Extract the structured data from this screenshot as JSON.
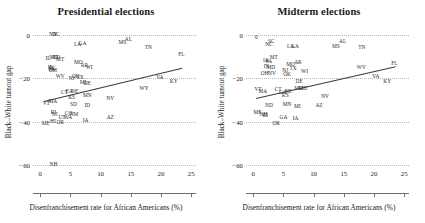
{
  "figure": {
    "yaxis_label": "Black–White turnout gap",
    "xaxis_label": "Disenfranchisement rate for African Americans (%)",
    "yticks": [
      "0",
      "−20",
      "−40",
      "−60"
    ],
    "xticks": [
      "0",
      "5",
      "10",
      "15",
      "20",
      "25"
    ],
    "line_color": "#3a3a3a",
    "grid_color": "#b9b9b9",
    "text_color": "#2b2b2b"
  },
  "chart_data": [
    {
      "type": "scatter",
      "title": "Presidential elections",
      "xlabel": "Disenfranchisement rate for African Americans (%)",
      "ylabel": "Black–White turnout gap",
      "xlim": [
        -1.2,
        25.8
      ],
      "ylim": [
        -65,
        3
      ],
      "xticks": [
        0,
        5,
        10,
        15,
        20,
        25
      ],
      "yticks": [
        0,
        -20,
        -40,
        -60
      ],
      "grid": "horizontal-dotted",
      "legend": "none",
      "point_labels": "US state abbreviations",
      "trendline": {
        "x": [
          0.6,
          23.5
        ],
        "y": [
          -30.5,
          -15.2
        ],
        "color": "#3a3a3a"
      },
      "points": [
        {
          "label": "NY",
          "x": 2.1,
          "y": -0.4
        },
        {
          "label": "DC",
          "x": 2.6,
          "y": -0.2
        },
        {
          "label": "LA",
          "x": 6.2,
          "y": -5.0
        },
        {
          "label": "GA",
          "x": 7.0,
          "y": -4.2
        },
        {
          "label": "AL",
          "x": 14.6,
          "y": -2.4
        },
        {
          "label": "MS",
          "x": 13.6,
          "y": -4.0
        },
        {
          "label": "TN",
          "x": 17.9,
          "y": -6.3
        },
        {
          "label": "FL",
          "x": 23.4,
          "y": -9.6
        },
        {
          "label": "IL",
          "x": 1.3,
          "y": -11.2
        },
        {
          "label": "MD",
          "x": 2.2,
          "y": -10.6
        },
        {
          "label": "ND",
          "x": 2.6,
          "y": -10.8
        },
        {
          "label": "MT",
          "x": 3.3,
          "y": -11.9
        },
        {
          "label": "MO",
          "x": 6.3,
          "y": -13.0
        },
        {
          "label": "AR",
          "x": 7.3,
          "y": -14.3
        },
        {
          "label": "WI",
          "x": 8.1,
          "y": -15.2
        },
        {
          "label": "IN",
          "x": 1.7,
          "y": -15.4
        },
        {
          "label": "PA",
          "x": 1.9,
          "y": -16.1
        },
        {
          "label": "OH",
          "x": 2.1,
          "y": -16.6
        },
        {
          "label": "SC",
          "x": 2.0,
          "y": -16.0
        },
        {
          "label": "WV",
          "x": 3.3,
          "y": -19.7
        },
        {
          "label": "NJ",
          "x": 5.2,
          "y": -20.6
        },
        {
          "label": "OK",
          "x": 5.9,
          "y": -19.3
        },
        {
          "label": "TX",
          "x": 6.6,
          "y": -20.2
        },
        {
          "label": "VA",
          "x": 19.8,
          "y": -20.1
        },
        {
          "label": "KY",
          "x": 22.1,
          "y": -21.9
        },
        {
          "label": "MI",
          "x": 7.1,
          "y": -22.1
        },
        {
          "label": "DE",
          "x": 7.8,
          "y": -22.6
        },
        {
          "label": "WY",
          "x": 17.2,
          "y": -24.8
        },
        {
          "label": "CT",
          "x": 4.0,
          "y": -26.8
        },
        {
          "label": "EA",
          "x": 4.8,
          "y": -26.4
        },
        {
          "label": "NE",
          "x": 5.7,
          "y": -26.3
        },
        {
          "label": "MN",
          "x": 7.8,
          "y": -28.4
        },
        {
          "label": "KS",
          "x": 5.2,
          "y": -29.2
        },
        {
          "label": "NV",
          "x": 11.6,
          "y": -29.5
        },
        {
          "label": "MA",
          "x": 2.1,
          "y": -31.0
        },
        {
          "label": "VT",
          "x": 1.0,
          "y": -32.0
        },
        {
          "label": "SD",
          "x": 5.5,
          "y": -32.3
        },
        {
          "label": "ID",
          "x": 7.8,
          "y": -32.8
        },
        {
          "label": "RI",
          "x": 2.2,
          "y": -36.2
        },
        {
          "label": "NJ",
          "x": 2.4,
          "y": -37.2
        },
        {
          "label": "CO",
          "x": 4.7,
          "y": -36.5
        },
        {
          "label": "NM",
          "x": 5.6,
          "y": -37.0
        },
        {
          "label": "UT",
          "x": 3.6,
          "y": -38.2
        },
        {
          "label": "WA",
          "x": 4.6,
          "y": -38.4
        },
        {
          "label": "IA",
          "x": 7.5,
          "y": -39.7
        },
        {
          "label": "AZ",
          "x": 11.6,
          "y": -38.4
        },
        {
          "label": "ME",
          "x": 0.9,
          "y": -41.3
        },
        {
          "label": "HI",
          "x": 2.1,
          "y": -40.4
        },
        {
          "label": "OR",
          "x": 3.3,
          "y": -40.8
        },
        {
          "label": "NH",
          "x": 2.2,
          "y": -59.8
        }
      ]
    },
    {
      "type": "scatter",
      "title": "Midterm elections",
      "xlabel": "Disenfranchisement rate for African Americans (%)",
      "ylabel": "Black–White turnout gap",
      "xlim": [
        -1.2,
        25.8
      ],
      "ylim": [
        -65,
        3
      ],
      "xticks": [
        0,
        5,
        10,
        15,
        20,
        25
      ],
      "yticks": [
        0,
        -20,
        -40,
        -60
      ],
      "grid": "horizontal-dotted",
      "legend": "none",
      "point_labels": "US state abbreviations",
      "trendline": {
        "x": [
          0.5,
          23.6
        ],
        "y": [
          -29.0,
          -14.4
        ],
        "color": "#3a3a3a"
      },
      "points": [
        {
          "label": "0",
          "x": 0.5,
          "y": -1.6
        },
        {
          "label": "SC",
          "x": 3.0,
          "y": -3.6
        },
        {
          "label": "NC",
          "x": 2.6,
          "y": -5.0
        },
        {
          "label": "LA",
          "x": 6.2,
          "y": -5.6
        },
        {
          "label": "GA",
          "x": 6.9,
          "y": -5.5
        },
        {
          "label": "AL",
          "x": 14.8,
          "y": -3.6
        },
        {
          "label": "MS",
          "x": 13.7,
          "y": -5.6
        },
        {
          "label": "TN",
          "x": 18.0,
          "y": -6.4
        },
        {
          "label": "MT",
          "x": 3.4,
          "y": -11.0
        },
        {
          "label": "IA",
          "x": 2.1,
          "y": -12.1
        },
        {
          "label": "PA",
          "x": 2.6,
          "y": -12.6
        },
        {
          "label": "MO",
          "x": 6.2,
          "y": -13.9
        },
        {
          "label": "AR",
          "x": 7.4,
          "y": -13.3
        },
        {
          "label": "MD",
          "x": 2.9,
          "y": -15.3
        },
        {
          "label": "IN",
          "x": 2.2,
          "y": -15.0
        },
        {
          "label": "FL",
          "x": 23.4,
          "y": -13.6
        },
        {
          "label": "WV",
          "x": 17.9,
          "y": -15.3
        },
        {
          "label": "NJ",
          "x": 5.3,
          "y": -16.6
        },
        {
          "label": "TX",
          "x": 6.6,
          "y": -16.0
        },
        {
          "label": "WI",
          "x": 8.5,
          "y": -17.2
        },
        {
          "label": "OH",
          "x": 1.9,
          "y": -18.3
        },
        {
          "label": "NV",
          "x": 3.1,
          "y": -18.1
        },
        {
          "label": "OK",
          "x": 5.6,
          "y": -18.4
        },
        {
          "label": "VA",
          "x": 20.3,
          "y": -19.6
        },
        {
          "label": "KY",
          "x": 22.2,
          "y": -21.6
        },
        {
          "label": "DE",
          "x": 7.6,
          "y": -21.9
        },
        {
          "label": "VT",
          "x": 0.8,
          "y": -25.3
        },
        {
          "label": "MA",
          "x": 1.6,
          "y": -26.6
        },
        {
          "label": "CT",
          "x": 4.1,
          "y": -25.3
        },
        {
          "label": "CA",
          "x": 4.9,
          "y": -26.8
        },
        {
          "label": "NE",
          "x": 5.8,
          "y": -26.6
        },
        {
          "label": "MO",
          "x": 7.5,
          "y": -25.0
        },
        {
          "label": "MD",
          "x": 8.2,
          "y": -25.1
        },
        {
          "label": "KS",
          "x": 5.3,
          "y": -28.2
        },
        {
          "label": "NV",
          "x": 11.9,
          "y": -28.6
        },
        {
          "label": "ND",
          "x": 2.6,
          "y": -32.7
        },
        {
          "label": "MN",
          "x": 5.6,
          "y": -32.4
        },
        {
          "label": "MI",
          "x": 7.3,
          "y": -33.2
        },
        {
          "label": "AZ",
          "x": 10.9,
          "y": -33.0
        },
        {
          "label": "ME",
          "x": 0.7,
          "y": -36.2
        },
        {
          "label": "NH",
          "x": 1.7,
          "y": -37.2
        },
        {
          "label": "RI",
          "x": 2.0,
          "y": -37.4
        },
        {
          "label": "GA",
          "x": 5.0,
          "y": -38.4
        },
        {
          "label": "IA",
          "x": 7.0,
          "y": -38.7
        },
        {
          "label": "OR",
          "x": 3.8,
          "y": -41.2
        }
      ]
    }
  ]
}
